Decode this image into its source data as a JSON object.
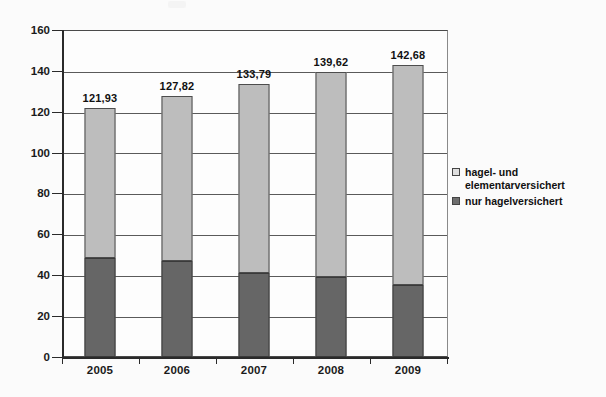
{
  "chart_data": {
    "type": "bar",
    "subtype": "stacked-column",
    "title": "",
    "xlabel": "",
    "ylabel": "",
    "categories": [
      "2005",
      "2006",
      "2007",
      "2008",
      "2009"
    ],
    "ylim": [
      0,
      160
    ],
    "ytick_step": 20,
    "yticks": [
      "0",
      "20",
      "40",
      "60",
      "80",
      "100",
      "120",
      "140",
      "160"
    ],
    "grid": true,
    "legend_position": "right",
    "series": [
      {
        "name": "nur hagelversichert",
        "color": "#666666",
        "values": [
          48.5,
          47.0,
          41.0,
          39.0,
          35.0
        ]
      },
      {
        "name": "hagel- und elementarversichert",
        "color": "#bdbdbd",
        "values": [
          73.43,
          80.82,
          92.79,
          100.62,
          107.68
        ]
      }
    ],
    "totals": [
      121.93,
      127.82,
      133.79,
      139.62,
      142.68
    ],
    "total_labels": [
      "121,93",
      "127,82",
      "133,79",
      "139,62",
      "142,68"
    ]
  },
  "legend": {
    "entries": [
      {
        "label": "hagel- und\nelementarversichert",
        "swatch": "light"
      },
      {
        "label": "nur hagelversichert",
        "swatch": "dark"
      }
    ]
  },
  "colors": {
    "series_light": "#bdbdbd",
    "series_dark": "#666666",
    "axis": "#2a2a2a",
    "grid": "#5a5a5a",
    "plot_background": "#fdfdfd",
    "page_background": "#fbfbfb"
  }
}
